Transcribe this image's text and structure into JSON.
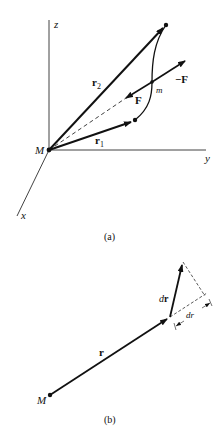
{
  "figure_a": {
    "caption": "(a)",
    "axes": {
      "z": "z",
      "y": "y",
      "x": "x"
    },
    "origin_label": "M",
    "vectors": {
      "r2": "r",
      "r2_sub": "2",
      "r1": "r",
      "r1_sub": "1",
      "force": "F",
      "neg_force": "−F"
    },
    "point_label": "m"
  },
  "figure_b": {
    "caption": "(b)",
    "origin_label": "M",
    "position_vector": "r",
    "differential_vector_d": "d",
    "differential_vector_r": "r",
    "radial_component_d": "d",
    "radial_component_r": "r"
  },
  "colors": {
    "ink": "#111111",
    "background": "#ffffff"
  }
}
